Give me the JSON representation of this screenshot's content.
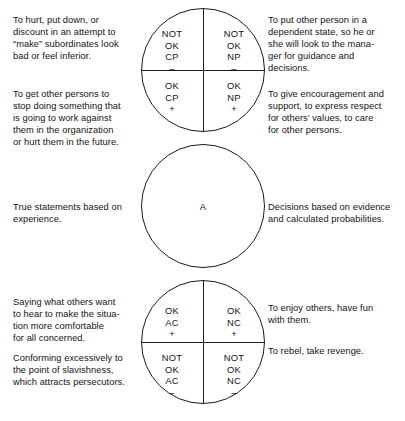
{
  "diagram": {
    "line_color": "#1b1b1b",
    "text_color": "#131313"
  },
  "circles": {
    "parent": {
      "name": "parent-circle",
      "quadrants": {
        "top_left": "NOT\nOK\nCP\n–",
        "top_right": "NOT\nOK\nNP\n–",
        "bottom_left": "OK\nCP\n+",
        "bottom_right": "OK\nNP\n+"
      }
    },
    "adult": {
      "name": "adult-circle",
      "label": "A"
    },
    "child": {
      "name": "child-circle",
      "quadrants": {
        "top_left": "OK\nAC\n+",
        "top_right": "OK\nNC\n+",
        "bottom_left": "NOT\nOK\nAC\n–",
        "bottom_right": "NOT\nOK\nNC\n–"
      }
    }
  },
  "notes": {
    "left_not_ok_cp": "To hurt, put down, or\ndiscount in an attempt to\n“make” subordinates look\nbad or feel inferior.",
    "left_ok_cp": "To get other persons to\nstop doing something that\nis going to work against\nthem in the organization\nor hurt them in the future.",
    "right_not_ok_np": "To put other person in a\ndependent state, so he or\nshe will look to the mana-\nger for guidance and\ndecisions.",
    "right_ok_np": "To give encouragement and\nsupport, to express respect\nfor others’ values, to care\nfor other persons.",
    "left_adult": "True statements based on\nexperience.",
    "right_adult": "Decisions based on evidence\nand calculated probabilities.",
    "left_ok_ac": "Saying what others want\nto hear to make the situa-\ntion more comfortable\nfor all concerned.",
    "left_not_ok_ac": "Conforming excessively to\nthe point of slavishness,\nwhich attracts persecutors.",
    "right_ok_nc": "To enjoy others, have fun\nwith them.",
    "right_not_ok_nc": "To rebel, take revenge."
  }
}
